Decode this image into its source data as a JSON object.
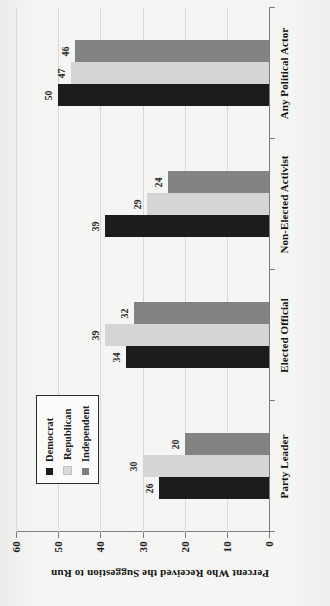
{
  "chart_data": {
    "type": "bar",
    "title": "",
    "subtitle": "",
    "xlabel": "",
    "ylabel": "Percent Who Received the Suggestion to Run",
    "ylim": [
      0,
      60
    ],
    "yticks": [
      0,
      10,
      20,
      30,
      40,
      50,
      60
    ],
    "ytick_labels": [
      "0",
      "10",
      "20",
      "30",
      "40",
      "50",
      "60"
    ],
    "grid": true,
    "grid_axis": "y",
    "orientation": "vertical-bars-rotated-90-ccw",
    "legend_position": "inside-left",
    "categories": [
      "Party Leader",
      "Elected Official",
      "Non-Elected Activist",
      "Any Political Actor"
    ],
    "series": [
      {
        "name": "Democrat",
        "color": "#1c1c1c",
        "values": [
          26,
          34,
          39,
          50
        ],
        "labels": [
          "26",
          "34",
          "39",
          "50"
        ]
      },
      {
        "name": "Republican",
        "color": "#d5d5d3",
        "values": [
          30,
          39,
          29,
          47
        ],
        "labels": [
          "30",
          "39",
          "29",
          "47"
        ]
      },
      {
        "name": "Independent",
        "color": "#838383",
        "values": [
          20,
          32,
          24,
          46
        ],
        "labels": [
          "20",
          "32",
          "24",
          "46"
        ]
      }
    ],
    "annotations": []
  },
  "legend": {
    "entries": [
      {
        "label": "Democrat",
        "swatch": "#1c1c1c"
      },
      {
        "label": "Republican",
        "swatch": "#d9d9d7"
      },
      {
        "label": "Independent",
        "swatch": "#7f7f7f"
      }
    ]
  },
  "axes": {
    "y_title": "Percent Who Received the Suggestion to Run",
    "y_tick_0": "0",
    "y_tick_10": "10",
    "y_tick_20": "20",
    "y_tick_30": "30",
    "y_tick_40": "40",
    "y_tick_50": "50",
    "y_tick_60": "60"
  },
  "colors": {
    "democrat": "#1c1c1c",
    "republican": "#d5d5d3",
    "independent": "#838383",
    "axis": "#7d7d7d",
    "grid": "#d8d8d6",
    "text": "#121212",
    "page_background": "#f5f5f3"
  }
}
